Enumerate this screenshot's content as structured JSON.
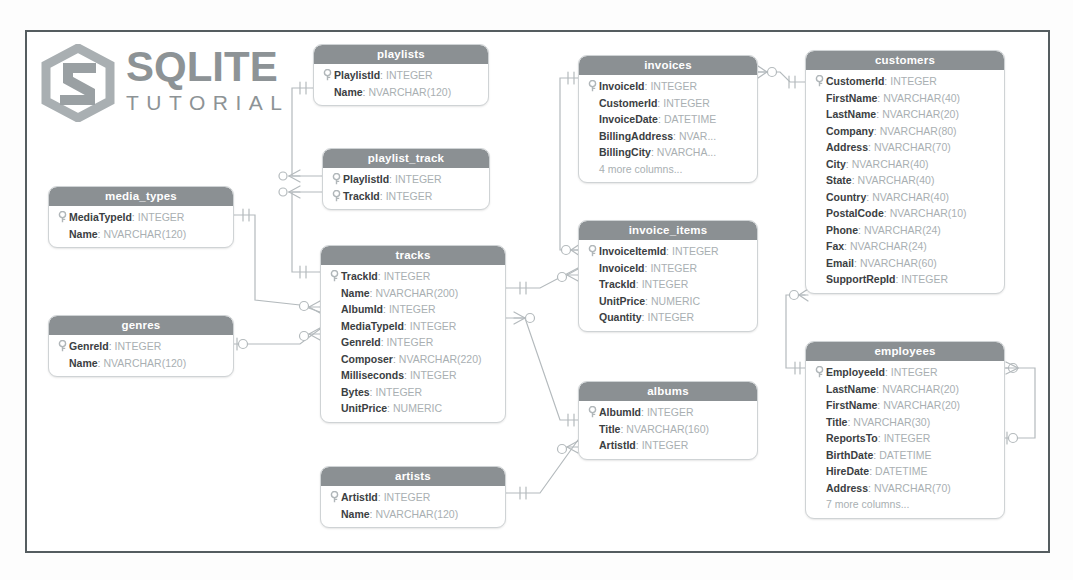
{
  "logo": {
    "primary": "SQLITE",
    "secondary": "TUTORIAL",
    "mark": "hexagon-s-logo",
    "color": "#8d9396"
  },
  "theme": {
    "header_bg": "#8b9093",
    "header_text": "#ffffff",
    "column_name": "#3b4042",
    "column_type": "#a9afb2",
    "box_border": "#cfd3d5",
    "frame_border": "#555d60",
    "connector": "#b4babd",
    "canvas_bg": "#ffffff"
  },
  "diagram": {
    "type": "entity-relationship-diagram",
    "notation": "crows-foot",
    "table_count": 11
  },
  "tables": [
    {
      "id": "playlists",
      "name": "playlists",
      "x": 313,
      "y": 44,
      "width": 176,
      "columns": [
        {
          "key": true,
          "name": "PlaylistId",
          "type": "INTEGER"
        },
        {
          "key": false,
          "name": "Name",
          "type": "NVARCHAR(120)"
        }
      ],
      "more": null
    },
    {
      "id": "playlist_track",
      "name": "playlist_track",
      "x": 322,
      "y": 148,
      "width": 168,
      "columns": [
        {
          "key": true,
          "name": "PlaylistId",
          "type": "INTEGER"
        },
        {
          "key": true,
          "name": "TrackId",
          "type": "INTEGER"
        }
      ],
      "more": null
    },
    {
      "id": "media_types",
      "name": "media_types",
      "x": 48,
      "y": 186,
      "width": 186,
      "columns": [
        {
          "key": true,
          "name": "MediaTypeId",
          "type": "INTEGER"
        },
        {
          "key": false,
          "name": "Name",
          "type": "NVARCHAR(120)"
        }
      ],
      "more": null
    },
    {
      "id": "genres",
      "name": "genres",
      "x": 48,
      "y": 315,
      "width": 186,
      "columns": [
        {
          "key": true,
          "name": "GenreId",
          "type": "INTEGER"
        },
        {
          "key": false,
          "name": "Name",
          "type": "NVARCHAR(120)"
        }
      ],
      "more": null
    },
    {
      "id": "tracks",
      "name": "tracks",
      "x": 320,
      "y": 245,
      "width": 186,
      "columns": [
        {
          "key": true,
          "name": "TrackId",
          "type": "INTEGER"
        },
        {
          "key": false,
          "name": "Name",
          "type": "NVARCHAR(200)"
        },
        {
          "key": false,
          "name": "AlbumId",
          "type": "INTEGER"
        },
        {
          "key": false,
          "name": "MediaTypeId",
          "type": "INTEGER"
        },
        {
          "key": false,
          "name": "GenreId",
          "type": "INTEGER"
        },
        {
          "key": false,
          "name": "Composer",
          "type": "NVARCHAR(220)"
        },
        {
          "key": false,
          "name": "Milliseconds",
          "type": "INTEGER"
        },
        {
          "key": false,
          "name": "Bytes",
          "type": "INTEGER"
        },
        {
          "key": false,
          "name": "UnitPrice",
          "type": "NUMERIC"
        }
      ],
      "more": null
    },
    {
      "id": "artists",
      "name": "artists",
      "x": 320,
      "y": 466,
      "width": 186,
      "columns": [
        {
          "key": true,
          "name": "ArtistId",
          "type": "INTEGER"
        },
        {
          "key": false,
          "name": "Name",
          "type": "NVARCHAR(120)"
        }
      ],
      "more": null
    },
    {
      "id": "invoices",
      "name": "invoices",
      "x": 578,
      "y": 55,
      "width": 180,
      "columns": [
        {
          "key": true,
          "name": "InvoiceId",
          "type": "INTEGER"
        },
        {
          "key": false,
          "name": "CustomerId",
          "type": "INTEGER"
        },
        {
          "key": false,
          "name": "InvoiceDate",
          "type": "DATETIME"
        },
        {
          "key": false,
          "name": "BillingAddress",
          "type": "NVAR..."
        },
        {
          "key": false,
          "name": "BillingCity",
          "type": "NVARCHA..."
        }
      ],
      "more": "4 more columns..."
    },
    {
      "id": "invoice_items",
      "name": "invoice_items",
      "x": 578,
      "y": 220,
      "width": 180,
      "columns": [
        {
          "key": true,
          "name": "InvoiceItemId",
          "type": "INTEGER"
        },
        {
          "key": false,
          "name": "InvoiceId",
          "type": "INTEGER"
        },
        {
          "key": false,
          "name": "TrackId",
          "type": "INTEGER"
        },
        {
          "key": false,
          "name": "UnitPrice",
          "type": "NUMERIC"
        },
        {
          "key": false,
          "name": "Quantity",
          "type": "INTEGER"
        }
      ],
      "more": null
    },
    {
      "id": "albums",
      "name": "albums",
      "x": 578,
      "y": 381,
      "width": 180,
      "columns": [
        {
          "key": true,
          "name": "AlbumId",
          "type": "INTEGER"
        },
        {
          "key": false,
          "name": "Title",
          "type": "NVARCHAR(160)"
        },
        {
          "key": false,
          "name": "ArtistId",
          "type": "INTEGER"
        }
      ],
      "more": null
    },
    {
      "id": "customers",
      "name": "customers",
      "x": 805,
      "y": 50,
      "width": 200,
      "columns": [
        {
          "key": true,
          "name": "CustomerId",
          "type": "INTEGER"
        },
        {
          "key": false,
          "name": "FirstName",
          "type": "NVARCHAR(40)"
        },
        {
          "key": false,
          "name": "LastName",
          "type": "NVARCHAR(20)"
        },
        {
          "key": false,
          "name": "Company",
          "type": "NVARCHAR(80)"
        },
        {
          "key": false,
          "name": "Address",
          "type": "NVARCHAR(70)"
        },
        {
          "key": false,
          "name": "City",
          "type": "NVARCHAR(40)"
        },
        {
          "key": false,
          "name": "State",
          "type": "NVARCHAR(40)"
        },
        {
          "key": false,
          "name": "Country",
          "type": "NVARCHAR(40)"
        },
        {
          "key": false,
          "name": "PostalCode",
          "type": "NVARCHAR(10)"
        },
        {
          "key": false,
          "name": "Phone",
          "type": "NVARCHAR(24)"
        },
        {
          "key": false,
          "name": "Fax",
          "type": "NVARCHAR(24)"
        },
        {
          "key": false,
          "name": "Email",
          "type": "NVARCHAR(60)"
        },
        {
          "key": false,
          "name": "SupportRepId",
          "type": "INTEGER"
        }
      ],
      "more": null
    },
    {
      "id": "employees",
      "name": "employees",
      "x": 805,
      "y": 341,
      "width": 200,
      "columns": [
        {
          "key": true,
          "name": "EmployeeId",
          "type": "INTEGER"
        },
        {
          "key": false,
          "name": "LastName",
          "type": "NVARCHAR(20)"
        },
        {
          "key": false,
          "name": "FirstName",
          "type": "NVARCHAR(20)"
        },
        {
          "key": false,
          "name": "Title",
          "type": "NVARCHAR(30)"
        },
        {
          "key": false,
          "name": "ReportsTo",
          "type": "INTEGER"
        },
        {
          "key": false,
          "name": "BirthDate",
          "type": "DATETIME"
        },
        {
          "key": false,
          "name": "HireDate",
          "type": "DATETIME"
        },
        {
          "key": false,
          "name": "Address",
          "type": "NVARCHAR(70)"
        }
      ],
      "more": "7 more columns..."
    }
  ]
}
